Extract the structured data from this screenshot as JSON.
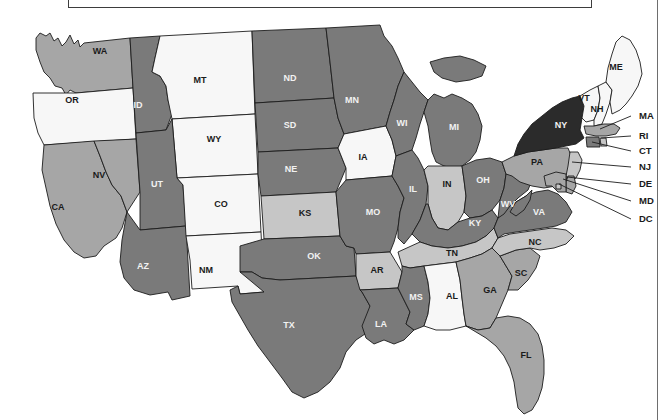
{
  "figure": {
    "type": "choropleth-map",
    "region": "United States (contiguous 48 states + DC)",
    "title_box_label": "",
    "background_color": "#ffffff",
    "border_color": "#1c1c1c"
  },
  "shades": {
    "near_black": "#2b2b2b",
    "dark_gray": "#7a7a7a",
    "medium_gray": "#a6a6a6",
    "light_gray": "#c6c6c6",
    "very_light": "#e9e9e9",
    "white": "#f7f7f7"
  },
  "chart_data": {
    "type": "heatmap",
    "title": "",
    "xlabel": "",
    "ylabel": "",
    "legend": [],
    "categories": [
      "WA",
      "OR",
      "CA",
      "NV",
      "ID",
      "MT",
      "WY",
      "UT",
      "AZ",
      "CO",
      "NM",
      "ND",
      "SD",
      "NE",
      "KS",
      "OK",
      "TX",
      "MN",
      "IA",
      "MO",
      "AR",
      "LA",
      "WI",
      "IL",
      "MI",
      "IN",
      "OH",
      "KY",
      "TN",
      "MS",
      "AL",
      "GA",
      "FL",
      "SC",
      "NC",
      "VA",
      "WV",
      "PA",
      "NY",
      "VT",
      "NH",
      "ME",
      "MA",
      "RI",
      "CT",
      "NJ",
      "DE",
      "MD",
      "DC"
    ],
    "values": [
      3,
      5,
      3,
      3,
      2,
      5,
      5,
      2,
      2,
      5,
      5,
      2,
      2,
      2,
      4,
      2,
      2,
      2,
      5,
      2,
      4,
      2,
      2,
      2,
      2,
      4,
      2,
      2,
      4,
      2,
      5,
      3,
      3,
      3,
      4,
      2,
      2,
      3,
      1,
      5,
      5,
      5,
      3,
      4,
      2,
      4,
      3,
      3,
      4
    ],
    "value_scale": {
      "1": "near_black",
      "2": "dark_gray",
      "3": "medium_gray",
      "4": "light_gray",
      "5": "white"
    }
  },
  "states": [
    {
      "id": "WA",
      "label": "WA",
      "shade": "medium_gray",
      "lx": 100,
      "ly": 52
    },
    {
      "id": "OR",
      "label": "OR",
      "shade": "white",
      "lx": 72,
      "ly": 101
    },
    {
      "id": "CA",
      "label": "CA",
      "shade": "medium_gray",
      "lx": 58,
      "ly": 208
    },
    {
      "id": "NV",
      "label": "NV",
      "shade": "medium_gray",
      "lx": 99,
      "ly": 176
    },
    {
      "id": "ID",
      "label": "ID",
      "shade": "dark_gray",
      "lx": 138,
      "ly": 106
    },
    {
      "id": "MT",
      "label": "MT",
      "shade": "white",
      "lx": 200,
      "ly": 81
    },
    {
      "id": "WY",
      "label": "WY",
      "shade": "white",
      "lx": 214,
      "ly": 140
    },
    {
      "id": "UT",
      "label": "UT",
      "shade": "dark_gray",
      "lx": 157,
      "ly": 185
    },
    {
      "id": "AZ",
      "label": "AZ",
      "shade": "dark_gray",
      "lx": 143,
      "ly": 267
    },
    {
      "id": "CO",
      "label": "CO",
      "shade": "white",
      "lx": 221,
      "ly": 205
    },
    {
      "id": "NM",
      "label": "NM",
      "shade": "white",
      "lx": 206,
      "ly": 271
    },
    {
      "id": "ND",
      "label": "ND",
      "shade": "dark_gray",
      "lx": 290,
      "ly": 79
    },
    {
      "id": "SD",
      "label": "SD",
      "shade": "dark_gray",
      "lx": 290,
      "ly": 126
    },
    {
      "id": "NE",
      "label": "NE",
      "shade": "dark_gray",
      "lx": 291,
      "ly": 170
    },
    {
      "id": "KS",
      "label": "KS",
      "shade": "light_gray",
      "lx": 305,
      "ly": 214
    },
    {
      "id": "OK",
      "label": "OK",
      "shade": "dark_gray",
      "lx": 314,
      "ly": 257
    },
    {
      "id": "TX",
      "label": "TX",
      "shade": "dark_gray",
      "lx": 289,
      "ly": 326
    },
    {
      "id": "MN",
      "label": "MN",
      "shade": "dark_gray",
      "lx": 352,
      "ly": 101
    },
    {
      "id": "IA",
      "label": "IA",
      "shade": "white",
      "lx": 363,
      "ly": 158
    },
    {
      "id": "MO",
      "label": "MO",
      "shade": "dark_gray",
      "lx": 373,
      "ly": 213
    },
    {
      "id": "AR",
      "label": "AR",
      "shade": "light_gray",
      "lx": 377,
      "ly": 271
    },
    {
      "id": "LA",
      "label": "LA",
      "shade": "dark_gray",
      "lx": 381,
      "ly": 325
    },
    {
      "id": "WI",
      "label": "WI",
      "shade": "dark_gray",
      "lx": 402,
      "ly": 124
    },
    {
      "id": "IL",
      "label": "IL",
      "shade": "dark_gray",
      "lx": 413,
      "ly": 190
    },
    {
      "id": "MI",
      "label": "MI",
      "shade": "dark_gray",
      "lx": 454,
      "ly": 128
    },
    {
      "id": "IN",
      "label": "IN",
      "shade": "light_gray",
      "lx": 447,
      "ly": 185
    },
    {
      "id": "OH",
      "label": "OH",
      "shade": "dark_gray",
      "lx": 483,
      "ly": 181
    },
    {
      "id": "KY",
      "label": "KY",
      "shade": "dark_gray",
      "lx": 475,
      "ly": 224
    },
    {
      "id": "TN",
      "label": "TN",
      "shade": "light_gray",
      "lx": 452,
      "ly": 254
    },
    {
      "id": "MS",
      "label": "MS",
      "shade": "dark_gray",
      "lx": 416,
      "ly": 298
    },
    {
      "id": "AL",
      "label": "AL",
      "shade": "white",
      "lx": 452,
      "ly": 297
    },
    {
      "id": "GA",
      "label": "GA",
      "shade": "medium_gray",
      "lx": 490,
      "ly": 291
    },
    {
      "id": "FL",
      "label": "FL",
      "shade": "medium_gray",
      "lx": 526,
      "ly": 356
    },
    {
      "id": "SC",
      "label": "SC",
      "shade": "medium_gray",
      "lx": 521,
      "ly": 274
    },
    {
      "id": "NC",
      "label": "NC",
      "shade": "light_gray",
      "lx": 535,
      "ly": 243
    },
    {
      "id": "VA",
      "label": "VA",
      "shade": "dark_gray",
      "lx": 539,
      "ly": 213
    },
    {
      "id": "WV",
      "label": "WV",
      "shade": "dark_gray",
      "lx": 508,
      "ly": 205
    },
    {
      "id": "PA",
      "label": "PA",
      "shade": "medium_gray",
      "lx": 537,
      "ly": 163
    },
    {
      "id": "NY",
      "label": "NY",
      "shade": "near_black",
      "lx": 561,
      "ly": 126
    },
    {
      "id": "VT",
      "label": "VT",
      "shade": "white",
      "lx": 584,
      "ly": 99
    },
    {
      "id": "NH",
      "label": "NH",
      "shade": "white",
      "lx": 597,
      "ly": 110
    },
    {
      "id": "ME",
      "label": "ME",
      "shade": "white",
      "lx": 616,
      "ly": 68
    }
  ],
  "callouts": [
    {
      "id": "MA",
      "label": "MA",
      "shade": "medium_gray",
      "tx": 639,
      "ty": 116,
      "ax": 600,
      "ay": 129
    },
    {
      "id": "RI",
      "label": "RI",
      "shade": "light_gray",
      "tx": 639,
      "ty": 136,
      "ax": 601,
      "ay": 138
    },
    {
      "id": "CT",
      "label": "CT",
      "shade": "dark_gray",
      "tx": 639,
      "ty": 151,
      "ax": 592,
      "ay": 142
    },
    {
      "id": "NJ",
      "label": "NJ",
      "shade": "light_gray",
      "tx": 639,
      "ty": 167,
      "ax": 572,
      "ay": 162
    },
    {
      "id": "DE",
      "label": "DE",
      "shade": "medium_gray",
      "tx": 639,
      "ty": 184,
      "ax": 567,
      "ay": 177
    },
    {
      "id": "MD",
      "label": "MD",
      "shade": "medium_gray",
      "tx": 639,
      "ty": 201,
      "ax": 563,
      "ay": 179
    },
    {
      "id": "DC",
      "label": "DC",
      "shade": "light_gray",
      "tx": 639,
      "ty": 219,
      "ax": 559,
      "ay": 184
    }
  ]
}
